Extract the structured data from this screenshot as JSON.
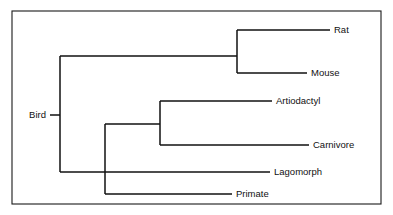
{
  "figure": {
    "type": "phylogenetic-cladogram",
    "title": "",
    "background_color": "#ffffff",
    "line_color": "#111111",
    "frame_color": "#1a1a1a",
    "text_color": "#111111",
    "frame": {
      "x": 12,
      "y": 11,
      "width": 369,
      "height": 193
    }
  },
  "taxa": [
    {
      "id": "rat",
      "label": "Rat",
      "label_x": 334,
      "label_y": 30,
      "tip_x": 330,
      "branch_from_x": 237
    },
    {
      "id": "mouse",
      "label": "Mouse",
      "label_x": 311,
      "label_y": 73,
      "tip_x": 307,
      "branch_from_x": 237
    },
    {
      "id": "artiodactyl",
      "label": "Artiodactyl",
      "label_x": 276,
      "label_y": 101,
      "tip_x": 272,
      "branch_from_x": 160
    },
    {
      "id": "carnivore",
      "label": "Carnivore",
      "label_x": 313,
      "label_y": 145,
      "tip_x": 309,
      "branch_from_x": 160
    },
    {
      "id": "lagomorph",
      "label": "Lagomorph",
      "label_x": 274,
      "label_y": 172,
      "tip_x": 270,
      "branch_from_x": 60
    },
    {
      "id": "primate",
      "label": "Primate",
      "label_x": 236,
      "label_y": 194,
      "tip_x": 232,
      "branch_from_x": 105
    },
    {
      "id": "bird",
      "label": "Bird",
      "label_x": 46,
      "label_y": 115,
      "tip_x": 50,
      "branch_from_x": 60
    }
  ],
  "nodes": [
    {
      "id": "root-node",
      "x": 60,
      "y_top": 56,
      "y_bottom": 172,
      "connector_y": 115
    },
    {
      "id": "rodent-node",
      "x": 237,
      "y_top": 30,
      "y_bottom": 73,
      "connector_y": 56
    },
    {
      "id": "ferungulate-node",
      "x": 160,
      "y_top": 101,
      "y_bottom": 145,
      "connector_y": 124
    },
    {
      "id": "euarchontoglires-node",
      "x": 105,
      "y_top": 124,
      "y_bottom": 194,
      "connector_y": 124
    }
  ],
  "segments": {
    "root_stub": {
      "x1": 50,
      "y1": 115,
      "x2": 60,
      "y2": 115
    },
    "root_to_rodents": {
      "x1": 60,
      "y1": 56,
      "x2": 237,
      "y2": 56
    },
    "root_to_lagomorph": {
      "x1": 60,
      "y1": 172,
      "x2": 270,
      "y2": 172
    },
    "rat_branch": {
      "x1": 237,
      "y1": 30,
      "x2": 330,
      "y2": 30
    },
    "mouse_branch": {
      "x1": 237,
      "y1": 73,
      "x2": 307,
      "y2": 73
    },
    "clade_to_ferungulate": {
      "x1": 105,
      "y1": 124,
      "x2": 160,
      "y2": 124
    },
    "artiodactyl_branch": {
      "x1": 160,
      "y1": 101,
      "x2": 272,
      "y2": 101
    },
    "carnivore_branch": {
      "x1": 160,
      "y1": 145,
      "x2": 309,
      "y2": 145
    },
    "primate_branch": {
      "x1": 105,
      "y1": 194,
      "x2": 232,
      "y2": 194
    }
  }
}
